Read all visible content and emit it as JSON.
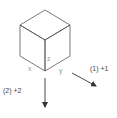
{
  "diagram": {
    "type": "isometric-cube",
    "colors": {
      "edge": "#555555",
      "axis_label": "#9a9a9a",
      "arrow": "#333333",
      "step_label": "#444444"
    },
    "axis_labels": {
      "x": "x",
      "y": "y",
      "z": "z"
    },
    "steps": [
      {
        "id": 1,
        "label": "(1) +1",
        "direction": "down-right"
      },
      {
        "id": 2,
        "label": "(2) +2",
        "direction": "down"
      }
    ]
  }
}
